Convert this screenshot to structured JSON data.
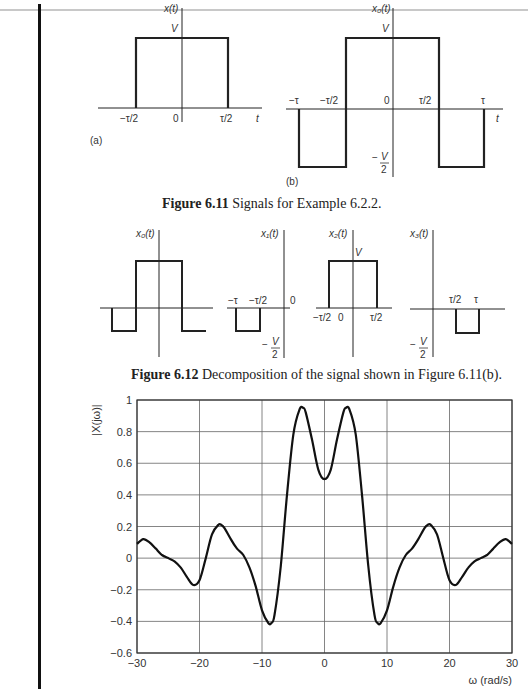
{
  "figure_6_11": {
    "caption_label": "Figure 6.11",
    "caption_text": "Signals for Example 6.2.2.",
    "panel_a": {
      "tag": "(a)",
      "ylabel": "x(t)",
      "xlabel": "t",
      "level_label": "V",
      "ticks": [
        "−τ/2",
        "0",
        "τ/2"
      ]
    },
    "panel_b": {
      "tag": "(b)",
      "ylabel": "x₀(t)",
      "xlabel": "t",
      "level_high": "V",
      "level_low_num": "V",
      "level_low_den": "2",
      "ticks": [
        "−τ",
        "−τ/2",
        "0",
        "τ/2",
        "τ"
      ]
    }
  },
  "figure_6_12": {
    "caption_label": "Figure 6.12",
    "caption_text": "Decomposition of the signal shown in Figure 6.11(b).",
    "panels": [
      {
        "ylabel": "x₀(t)"
      },
      {
        "ylabel": "x₁(t)",
        "ticks": [
          "−τ",
          "−τ/2",
          "0"
        ],
        "low_num": "V",
        "low_den": "2"
      },
      {
        "ylabel": "x₂(t)",
        "level": "V",
        "ticks": [
          "−τ/2",
          "0",
          "τ/2"
        ]
      },
      {
        "ylabel": "x₃(t)",
        "ticks": [
          "τ/2",
          "τ"
        ],
        "low_num": "V",
        "low_den": "2"
      }
    ]
  },
  "spectrum_plot": {
    "ylabel": "|X(jω)|",
    "xlabel": "ω (rad/s)"
  },
  "chart_data": {
    "type": "line",
    "title": "",
    "xlabel": "ω (rad/s)",
    "ylabel": "|X(jω)|",
    "xlim": [
      -30,
      30
    ],
    "ylim": [
      -0.6,
      1
    ],
    "grid": true,
    "xticks": [
      -30,
      -20,
      -10,
      0,
      10,
      20,
      30
    ],
    "xtick_labels": [
      "−30",
      "−20",
      "−10",
      "0",
      "10",
      "20",
      "30"
    ],
    "yticks": [
      -0.6,
      -0.4,
      -0.2,
      0,
      0.2,
      0.4,
      0.6,
      0.8,
      1
    ],
    "ytick_labels": [
      "−0.6",
      "−0.4",
      "−0.2",
      "0",
      "0.2",
      "0.4",
      "0.6",
      "0.8",
      "1"
    ],
    "series": [
      {
        "name": "|X(jω)|",
        "x": [
          -30,
          -29,
          -28,
          -27,
          -26,
          -25,
          -24,
          -23,
          -22,
          -21,
          -20,
          -19,
          -18,
          -17,
          -16.5,
          -16,
          -15,
          -14,
          -13,
          -12,
          -11,
          -10,
          -9,
          -8.5,
          -8,
          -7,
          -6,
          -5,
          -4,
          -3.4,
          -3,
          -2,
          -1,
          0,
          1,
          2,
          3,
          3.4,
          4,
          5,
          6,
          7,
          8,
          8.5,
          9,
          10,
          11,
          12,
          13,
          14,
          15,
          16,
          16.5,
          17,
          18,
          19,
          20,
          21,
          22,
          23,
          24,
          25,
          26,
          27,
          28,
          29,
          30
        ],
        "y": [
          0.09,
          0.12,
          0.1,
          0.06,
          0.02,
          0.0,
          -0.02,
          -0.06,
          -0.12,
          -0.17,
          -0.14,
          0.0,
          0.15,
          0.21,
          0.21,
          0.19,
          0.12,
          0.06,
          0.02,
          -0.06,
          -0.18,
          -0.33,
          -0.41,
          -0.41,
          -0.36,
          -0.05,
          0.4,
          0.78,
          0.94,
          0.95,
          0.92,
          0.75,
          0.56,
          0.5,
          0.56,
          0.75,
          0.92,
          0.95,
          0.94,
          0.78,
          0.4,
          -0.05,
          -0.36,
          -0.41,
          -0.41,
          -0.33,
          -0.18,
          -0.06,
          0.02,
          0.06,
          0.12,
          0.19,
          0.21,
          0.21,
          0.15,
          0.0,
          -0.14,
          -0.17,
          -0.12,
          -0.06,
          -0.02,
          0.0,
          0.02,
          0.06,
          0.1,
          0.12,
          0.09
        ]
      }
    ]
  }
}
